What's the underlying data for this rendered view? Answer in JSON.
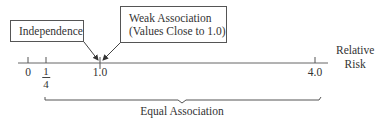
{
  "diagram": {
    "boxes": {
      "independence": "Independence",
      "weak_association_line1": "Weak Association",
      "weak_association_line2": "(Values Close to 1.0)"
    },
    "axis": {
      "label_line1": "Relative",
      "label_line2": "Risk",
      "ticks": [
        {
          "label": "0",
          "x": 28
        },
        {
          "label_numerator": "1",
          "label_denominator": "4",
          "x": 46
        },
        {
          "label": "1.0",
          "x": 100
        },
        {
          "label": "4.0",
          "x": 315
        }
      ]
    },
    "brace": {
      "label": "Equal Association",
      "from": "1/4",
      "to": "4.0"
    },
    "colors": {
      "line": "#555555",
      "text": "#333333",
      "background": "#ffffff"
    }
  }
}
